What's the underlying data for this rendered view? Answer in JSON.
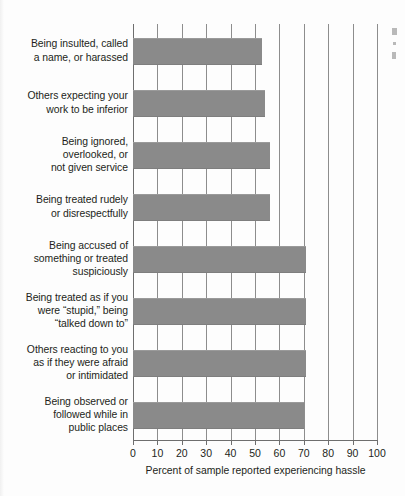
{
  "chart_data": {
    "type": "bar",
    "orientation": "horizontal",
    "title": "",
    "xlabel": "Percent of sample reported experiencing hassle",
    "ylabel": "",
    "xlim": [
      0,
      100
    ],
    "xticks": [
      0,
      10,
      20,
      30,
      40,
      50,
      60,
      70,
      80,
      90,
      100
    ],
    "xtick_labels": [
      "0",
      "10",
      "20",
      "30",
      "40",
      "50",
      "60",
      "70",
      "80",
      "90",
      "100"
    ],
    "grid": true,
    "grid_axis": "x",
    "legend": "none",
    "bar_color": "#8a8a8a",
    "categories": [
      "Being insulted, called\na name, or harassed",
      "Others expecting your\nwork to be inferior",
      "Being ignored,\noverlooked, or\nnot given service",
      "Being treated rudely\nor disrespectfully",
      "Being accused of\nsomething or treated\nsuspiciously",
      "Being treated as if you\nwere “stupid,” being\n“talked down to”",
      "Others reacting to you\nas if they were afraid\nor intimidated",
      "Being observed or\nfollowed while in\npublic places"
    ],
    "values": [
      53,
      54,
      56,
      56,
      71,
      71,
      71,
      70
    ]
  },
  "categories": [
    {
      "lines": [
        "Being insulted, called",
        "a name, or harassed"
      ],
      "value": 53
    },
    {
      "lines": [
        "Others expecting your",
        "work to be inferior"
      ],
      "value": 54
    },
    {
      "lines": [
        "Being ignored,",
        "overlooked, or",
        "not given service"
      ],
      "value": 56
    },
    {
      "lines": [
        "Being treated rudely",
        "or disrespectfully"
      ],
      "value": 56
    },
    {
      "lines": [
        "Being accused of",
        "something or treated",
        "suspiciously"
      ],
      "value": 71
    },
    {
      "lines": [
        "Being treated as if you",
        "were “stupid,” being",
        "“talked down to”"
      ],
      "value": 71
    },
    {
      "lines": [
        "Others reacting to you",
        "as if they were afraid",
        "or intimidated"
      ],
      "value": 71
    },
    {
      "lines": [
        "Being observed or",
        "followed while in",
        "public places"
      ],
      "value": 70
    }
  ],
  "axis": {
    "x_title": "Percent of sample reported experiencing hassle",
    "ticks": [
      "0",
      "10",
      "20",
      "30",
      "40",
      "50",
      "60",
      "70",
      "80",
      "90",
      "100"
    ]
  },
  "colors": {
    "bar": "#8a8a8a",
    "grid": "#8d8d8d",
    "text": "#231f20",
    "background": "#fdfdfd"
  }
}
